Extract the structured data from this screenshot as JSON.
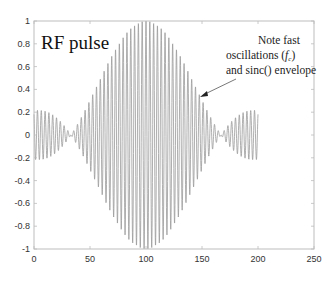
{
  "chart_data": {
    "type": "line",
    "title": "RF pulse",
    "xlabel": "",
    "ylabel": "",
    "xlim": [
      0,
      250
    ],
    "ylim": [
      -1,
      1
    ],
    "grid": false,
    "legend": null,
    "x_ticks": [
      0,
      50,
      100,
      150,
      200,
      250
    ],
    "y_ticks": [
      -1,
      -0.8,
      -0.6,
      -0.4,
      -0.2,
      0,
      0.2,
      0.4,
      0.6,
      0.8,
      1
    ],
    "x_tick_labels": [
      "0",
      "50",
      "100",
      "150",
      "200",
      "250"
    ],
    "y_tick_labels": [
      "-1",
      "-0.8",
      "-0.6",
      "-0.4",
      "-0.2",
      "0",
      "0.2",
      "0.4",
      "0.6",
      "0.8",
      "1"
    ],
    "series": [
      {
        "name": "RF pulse",
        "description": "Fast carrier oscillation modulated by a sinc envelope",
        "x_range": [
          0,
          200
        ],
        "center": 100,
        "peak_amplitude": 1.0,
        "sidelobe_amplitude": 0.2,
        "envelope_nulls": [
          33,
          167
        ],
        "carrier_period": 3.4,
        "color": "#9a9a9a"
      }
    ],
    "annotations": [
      {
        "text_lines": [
          "Note fast",
          "oscillations (fₑ)",
          "and sinc() envelope"
        ],
        "arrow_from": [
          178,
          0.47
        ],
        "arrow_to": [
          148,
          0.33
        ]
      }
    ]
  },
  "labels": {
    "title": "RF pulse",
    "note_line1": "Note fast",
    "note_line2_prefix": "oscillations (",
    "note_line2_symbol": "f",
    "note_line2_sub": "c",
    "note_line2_suffix": ")",
    "note_line3": "and sinc() envelope"
  },
  "colors": {
    "axis": "#bdbdbd",
    "signal": "#9a9a9a",
    "text": "#222222"
  }
}
